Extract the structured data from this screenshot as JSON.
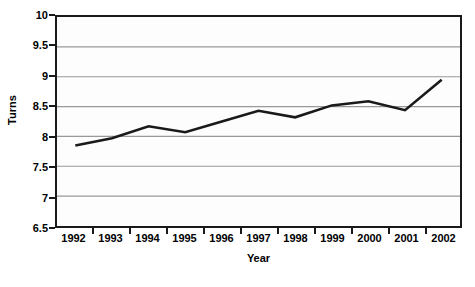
{
  "chart_data": {
    "type": "line",
    "title": "",
    "xlabel": "Year",
    "ylabel": "Turns",
    "categories": [
      "1992",
      "1993",
      "1994",
      "1995",
      "1996",
      "1997",
      "1998",
      "1999",
      "2000",
      "2001",
      "2002"
    ],
    "values": [
      7.85,
      7.97,
      8.17,
      8.07,
      8.25,
      8.43,
      8.32,
      8.52,
      8.59,
      8.44,
      8.95
    ],
    "series": [
      {
        "name": "Turns",
        "values": [
          7.85,
          7.97,
          8.17,
          8.07,
          8.25,
          8.43,
          8.32,
          8.52,
          8.59,
          8.44,
          8.95
        ]
      }
    ],
    "ylim": [
      6.5,
      10
    ],
    "ytick_labels": [
      "10",
      "9.5",
      "9",
      "8.5",
      "8",
      "7.5",
      "7",
      "6.5"
    ],
    "ytick_values": [
      10,
      9.5,
      9,
      8.5,
      8,
      7.5,
      7,
      6.5
    ],
    "grid": true,
    "grid_axis": "y",
    "legend": false,
    "legend_position": "none",
    "colors": {
      "line": "#1a1a1a",
      "grid": "#999999",
      "axis": "#1a1a1a",
      "plot_background": "#fdfdfd",
      "page_background": "#ffffff",
      "text": "#000000"
    }
  }
}
